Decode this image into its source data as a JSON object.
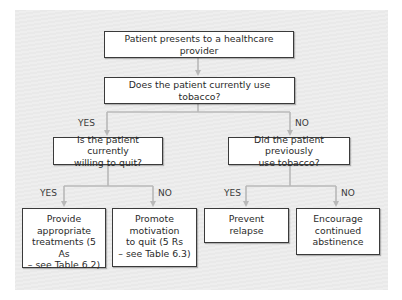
{
  "diagram": {
    "type": "flowchart",
    "colors": {
      "panel_background": "#ebebeb",
      "box_fill": "#ffffff",
      "box_border": "#3a3a3a",
      "connector": "#b8b8b8",
      "text": "#2a2a2a"
    },
    "nodes": {
      "start": {
        "label": "Patient presents to a healthcare provider"
      },
      "q_current": {
        "label": "Does the patient currently use tobacco?"
      },
      "q_willing": {
        "label": "Is the patient currently\nwilling to quit?"
      },
      "q_previous": {
        "label": "Did the patient previously\nuse tobacco?"
      },
      "provide_treatment": {
        "label": "Provide\nappropriate\ntreatments (5 As\n– see Table 6.2)"
      },
      "promote_motivation": {
        "label": "Promote\nmotivation\nto quit (5 Rs\n– see Table 6.3)"
      },
      "prevent_relapse": {
        "label": "Prevent\nrelapse"
      },
      "encourage_abstinence": {
        "label": "Encourage\ncontinued\nabstinence"
      }
    },
    "edge_labels": {
      "current_yes": "YES",
      "current_no": "NO",
      "willing_yes": "YES",
      "willing_no": "NO",
      "previous_yes": "YES",
      "previous_no": "NO"
    },
    "edges": [
      {
        "from": "start",
        "to": "q_current",
        "label": ""
      },
      {
        "from": "q_current",
        "to": "q_willing",
        "label": "YES"
      },
      {
        "from": "q_current",
        "to": "q_previous",
        "label": "NO"
      },
      {
        "from": "q_willing",
        "to": "provide_treatment",
        "label": "YES"
      },
      {
        "from": "q_willing",
        "to": "promote_motivation",
        "label": "NO"
      },
      {
        "from": "q_previous",
        "to": "prevent_relapse",
        "label": "YES"
      },
      {
        "from": "q_previous",
        "to": "encourage_abstinence",
        "label": "NO"
      }
    ]
  }
}
